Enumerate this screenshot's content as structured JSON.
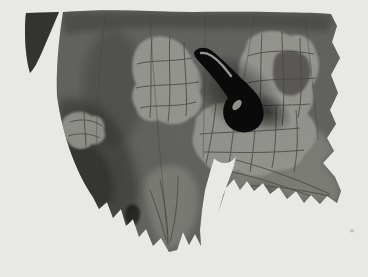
{
  "image": {
    "kind": "black-and-white halftone photograph",
    "alt": "Dark slug-shaped larva feeding on a leaf; pale skeletonized patches show the vein network, leaf margin jagged, white background",
    "subject": {
      "larva": "black glossy tadpole-shaped larva, tail up-left, bulbous end lower-right",
      "leaf": "gray leaf blade with eaten light patches and toothed lower edge",
      "background": "plain white paper"
    },
    "colors": {
      "background": "#f6f6f3",
      "leaf_base": "#8f8f8a",
      "leaf_dark": "#3c3c37",
      "lobe_dark": "#4b4b46",
      "patch_light": "#d8d8d1",
      "patch_mid": "#bbbbb3",
      "island_dark": "#7b7a73",
      "vein_dark": "#5e5e57",
      "vein_patch": "#6c6c63",
      "larva_black": "#111110",
      "larva_highlight": "#f3f3ee",
      "shadow": "#17170f"
    }
  }
}
